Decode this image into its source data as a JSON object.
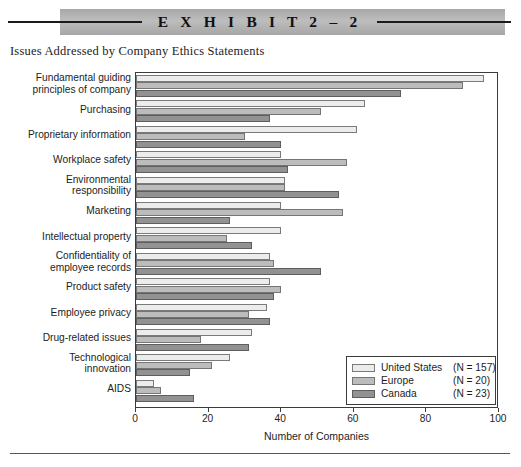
{
  "header": {
    "exhibit_title": "E X H I B I T   2 – 2"
  },
  "subtitle": "Issues Addressed by Company Ethics Statements",
  "legend": {
    "entries": [
      {
        "label": "United States",
        "n": "(N = 157)",
        "key": "us"
      },
      {
        "label": "Europe",
        "n": "(N = 20)",
        "key": "europe"
      },
      {
        "label": "Canada",
        "n": "(N = 23)",
        "key": "canada"
      }
    ]
  },
  "axis": {
    "x_title": "Number of Companies",
    "ticks": [
      "0",
      "20",
      "40",
      "60",
      "80",
      "100"
    ]
  },
  "chart_data": {
    "type": "bar",
    "orientation": "horizontal",
    "title": "Issues Addressed by Company Ethics Statements",
    "xlabel": "Number of Companies",
    "ylabel": "",
    "xlim": [
      0,
      100
    ],
    "grid": false,
    "legend_position": "inside-bottom-right",
    "categories": [
      "Fundamental guiding\nprinciples of company",
      "Purchasing",
      "Proprietary information",
      "Workplace safety",
      "Environmental\nresponsibility",
      "Marketing",
      "Intellectual property",
      "Confidentiality of\nemployee records",
      "Product safety",
      "Employee privacy",
      "Drug-related issues",
      "Technological\ninnovation",
      "AIDS"
    ],
    "series": [
      {
        "name": "United States",
        "color": "#ececec",
        "n": 157,
        "values": [
          96,
          63,
          61,
          40,
          41,
          40,
          40,
          37,
          37,
          36,
          32,
          26,
          5
        ]
      },
      {
        "name": "Europe",
        "color": "#bcbcbc",
        "n": 20,
        "values": [
          90,
          51,
          30,
          58,
          41,
          57,
          25,
          38,
          40,
          31,
          18,
          21,
          7
        ]
      },
      {
        "name": "Canada",
        "color": "#929292",
        "n": 23,
        "values": [
          73,
          37,
          40,
          42,
          56,
          26,
          32,
          51,
          38,
          37,
          31,
          15,
          16
        ]
      }
    ]
  }
}
